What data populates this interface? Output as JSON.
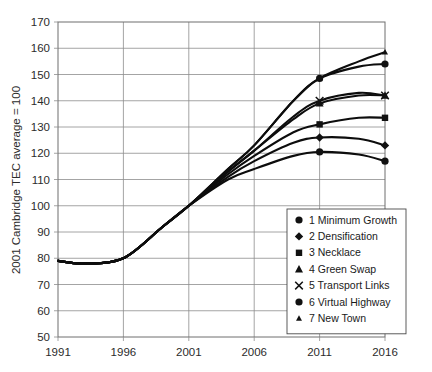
{
  "chart_data": {
    "type": "line",
    "title": "",
    "subtitle": "",
    "xlabel": "",
    "ylabel": "2001 Cambridge TEC average = 100",
    "xlim": [
      1991,
      2016
    ],
    "ylim": [
      50,
      170
    ],
    "yticks": [
      50,
      60,
      70,
      80,
      90,
      100,
      110,
      120,
      130,
      140,
      150,
      160,
      170
    ],
    "xticks": [
      1991,
      1996,
      2001,
      2006,
      2011,
      2016
    ],
    "grid": true,
    "legend_position": "lower-right-inside",
    "x": [
      1991,
      1993,
      1996,
      1999,
      2001,
      2004,
      2006,
      2009,
      2011,
      2014,
      2016
    ],
    "series": [
      {
        "name": "1 Minimum Growth",
        "number": 1,
        "label": "1 Minimum Growth",
        "marker": "circle",
        "values": [
          79,
          78,
          80,
          92,
          100,
          110,
          114,
          119,
          120.5,
          119.5,
          117
        ]
      },
      {
        "name": "2 Densification",
        "number": 2,
        "label": "2 Densification",
        "marker": "diamond",
        "values": [
          79,
          78,
          80,
          92,
          100,
          111,
          117,
          124,
          126,
          125.5,
          123
        ]
      },
      {
        "name": "3 Necklace",
        "number": 3,
        "label": "3 Necklace",
        "marker": "square",
        "values": [
          79,
          78,
          80,
          92,
          100,
          112,
          119,
          128,
          131,
          133.5,
          133.5
        ]
      },
      {
        "name": "4 Green Swap",
        "number": 4,
        "label": "4 Green Swap",
        "marker": "triangle",
        "values": [
          79,
          78,
          80,
          92,
          100,
          113,
          121,
          133,
          139,
          142,
          142
        ]
      },
      {
        "name": "5 Transport Links",
        "number": 5,
        "label": "5 Transport Links",
        "marker": "cross",
        "values": [
          79,
          78,
          80,
          92,
          100,
          113,
          121,
          134,
          140,
          143,
          142
        ]
      },
      {
        "name": "6 Virtual Highway",
        "number": 6,
        "label": "6 Virtual Highway",
        "marker": "circle",
        "values": [
          79,
          78,
          80,
          92,
          100,
          114,
          123,
          140,
          148.5,
          153,
          154
        ]
      },
      {
        "name": "7 New Town",
        "number": 7,
        "label": "7 New Town",
        "marker": "triangle-small",
        "values": [
          79,
          78,
          80,
          92,
          100,
          114,
          123,
          140,
          148.5,
          155,
          158.5
        ]
      }
    ]
  },
  "legend": {
    "items": [
      {
        "marker": "circle",
        "label": "1 Minimum Growth"
      },
      {
        "marker": "diamond",
        "label": "2 Densification"
      },
      {
        "marker": "square",
        "label": "3 Necklace"
      },
      {
        "marker": "triangle",
        "label": "4 Green Swap"
      },
      {
        "marker": "cross",
        "label": "5 Transport Links"
      },
      {
        "marker": "circle",
        "label": "6 Virtual Highway"
      },
      {
        "marker": "triangle-small",
        "label": "7 New Town"
      }
    ]
  },
  "colors": {
    "line": "#0d0d0d",
    "grid": "#8d8d8d",
    "frame": "#6e6e6e",
    "text": "#1a1a1a",
    "background": "#ffffff"
  }
}
